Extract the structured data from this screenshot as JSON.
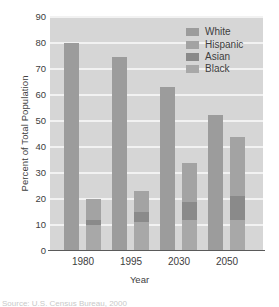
{
  "chart_data": {
    "type": "bar",
    "title": "",
    "subtitle": "",
    "xlabel": "Year",
    "ylabel": "Percent of Total Population",
    "categories": [
      "1980",
      "1995",
      "2030",
      "2050"
    ],
    "ylim": [
      0,
      90
    ],
    "yticks": [
      0,
      10,
      20,
      30,
      40,
      50,
      60,
      70,
      80,
      90
    ],
    "grid": true,
    "legend_position": "top-right",
    "legend": [
      "White",
      "Hispanic",
      "Asian",
      "Black"
    ],
    "series": [
      {
        "name": "White",
        "values": [
          80,
          74.5,
          63,
          52.5
        ]
      },
      {
        "name": "Hispanic",
        "values": [
          8,
          8,
          15,
          23
        ]
      },
      {
        "name": "Asian",
        "values": [
          2,
          4,
          7,
          9
        ]
      },
      {
        "name": "Black",
        "values": [
          10,
          11,
          12,
          12
        ]
      }
    ],
    "stacked_totals": [
      20,
      23,
      34,
      44
    ]
  },
  "colors": {
    "plot_background": "#d6d6d6",
    "gridline": "#f2f2f2",
    "axis": "#5a5a5a",
    "white_series": "#9c9c9c",
    "hispanic_series": "#a3a3a3",
    "asian_series": "#8a8a8a",
    "black_series": "#a8a8a8",
    "text": "#3d3d3d"
  },
  "caption": {
    "text": "Source: U.S. Census Bureau, 2000"
  }
}
